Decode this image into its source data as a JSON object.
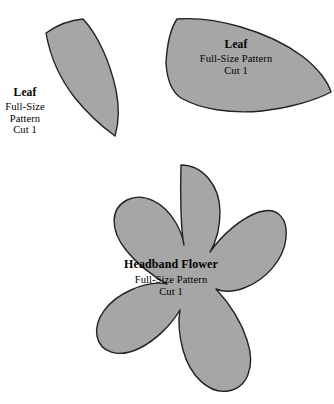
{
  "page": {
    "background_color": "#ffffff",
    "width": 334,
    "height": 404
  },
  "style": {
    "shape_fill": "#a6a6a6",
    "shape_stroke": "#222222",
    "text_color": "#000000"
  },
  "pieces": [
    {
      "id": "leaf-left",
      "name": "Leaf",
      "shape": "curved-leaf",
      "title": "Leaf",
      "lines": [
        "Full-Size",
        "Pattern",
        "Cut 1"
      ],
      "label_placement": "outside-left",
      "cut_quantity": "Cut 1"
    },
    {
      "id": "leaf-right",
      "name": "Leaf",
      "shape": "pointed-lens-leaf",
      "title": "Leaf",
      "lines": [
        "Full-Size Pattern",
        "Cut 1"
      ],
      "label_placement": "inside",
      "cut_quantity": "Cut 1"
    },
    {
      "id": "headband-flower",
      "name": "Headband Flower",
      "shape": "five-petal-flower",
      "title": "Headband Flower",
      "lines": [
        "Full-Size Pattern",
        "Cut 1"
      ],
      "label_placement": "inside",
      "cut_quantity": "Cut 1"
    }
  ]
}
